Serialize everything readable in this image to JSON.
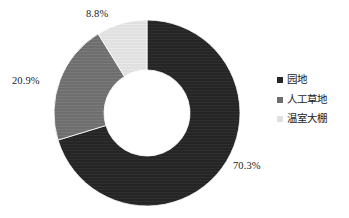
{
  "chart_data": {
    "type": "pie",
    "variant": "donut",
    "title": "",
    "xlabel": "",
    "ylabel": "",
    "grid": false,
    "legend_position": "right",
    "start_angle_deg": 0,
    "direction": "clockwise",
    "center": {
      "x": 147,
      "y": 113
    },
    "outer_radius": 93,
    "inner_radius": 43,
    "background_color": "#ffffff",
    "categories": [
      "园地",
      "人工草地",
      "温室大棚"
    ],
    "values": [
      70.3,
      20.9,
      8.8
    ],
    "value_labels": [
      "70.3%",
      "20.9%",
      "8.8%"
    ],
    "colors": [
      "#252525",
      "#6e6e6e",
      "#e0e0e0"
    ],
    "slices": [
      {
        "label": "园地",
        "value": 70.3,
        "value_label": "70.3%",
        "color": "#252525",
        "start_deg": 0,
        "end_deg": 253.08
      },
      {
        "label": "人工草地",
        "value": 20.9,
        "value_label": "20.9%",
        "color": "#6e6e6e",
        "start_deg": 253.08,
        "end_deg": 328.32
      },
      {
        "label": "温室大棚",
        "value": 8.8,
        "value_label": "8.8%",
        "color": "#e0e0e0",
        "start_deg": 328.32,
        "end_deg": 360
      }
    ]
  },
  "labels": {
    "top": "8.8%",
    "left": "20.9%",
    "bottom": "70.3%"
  },
  "legend": {
    "items": [
      {
        "label": "园地",
        "color": "#252525"
      },
      {
        "label": "人工草地",
        "color": "#6e6e6e"
      },
      {
        "label": "温室大棚",
        "color": "#e0e0e0"
      }
    ]
  }
}
